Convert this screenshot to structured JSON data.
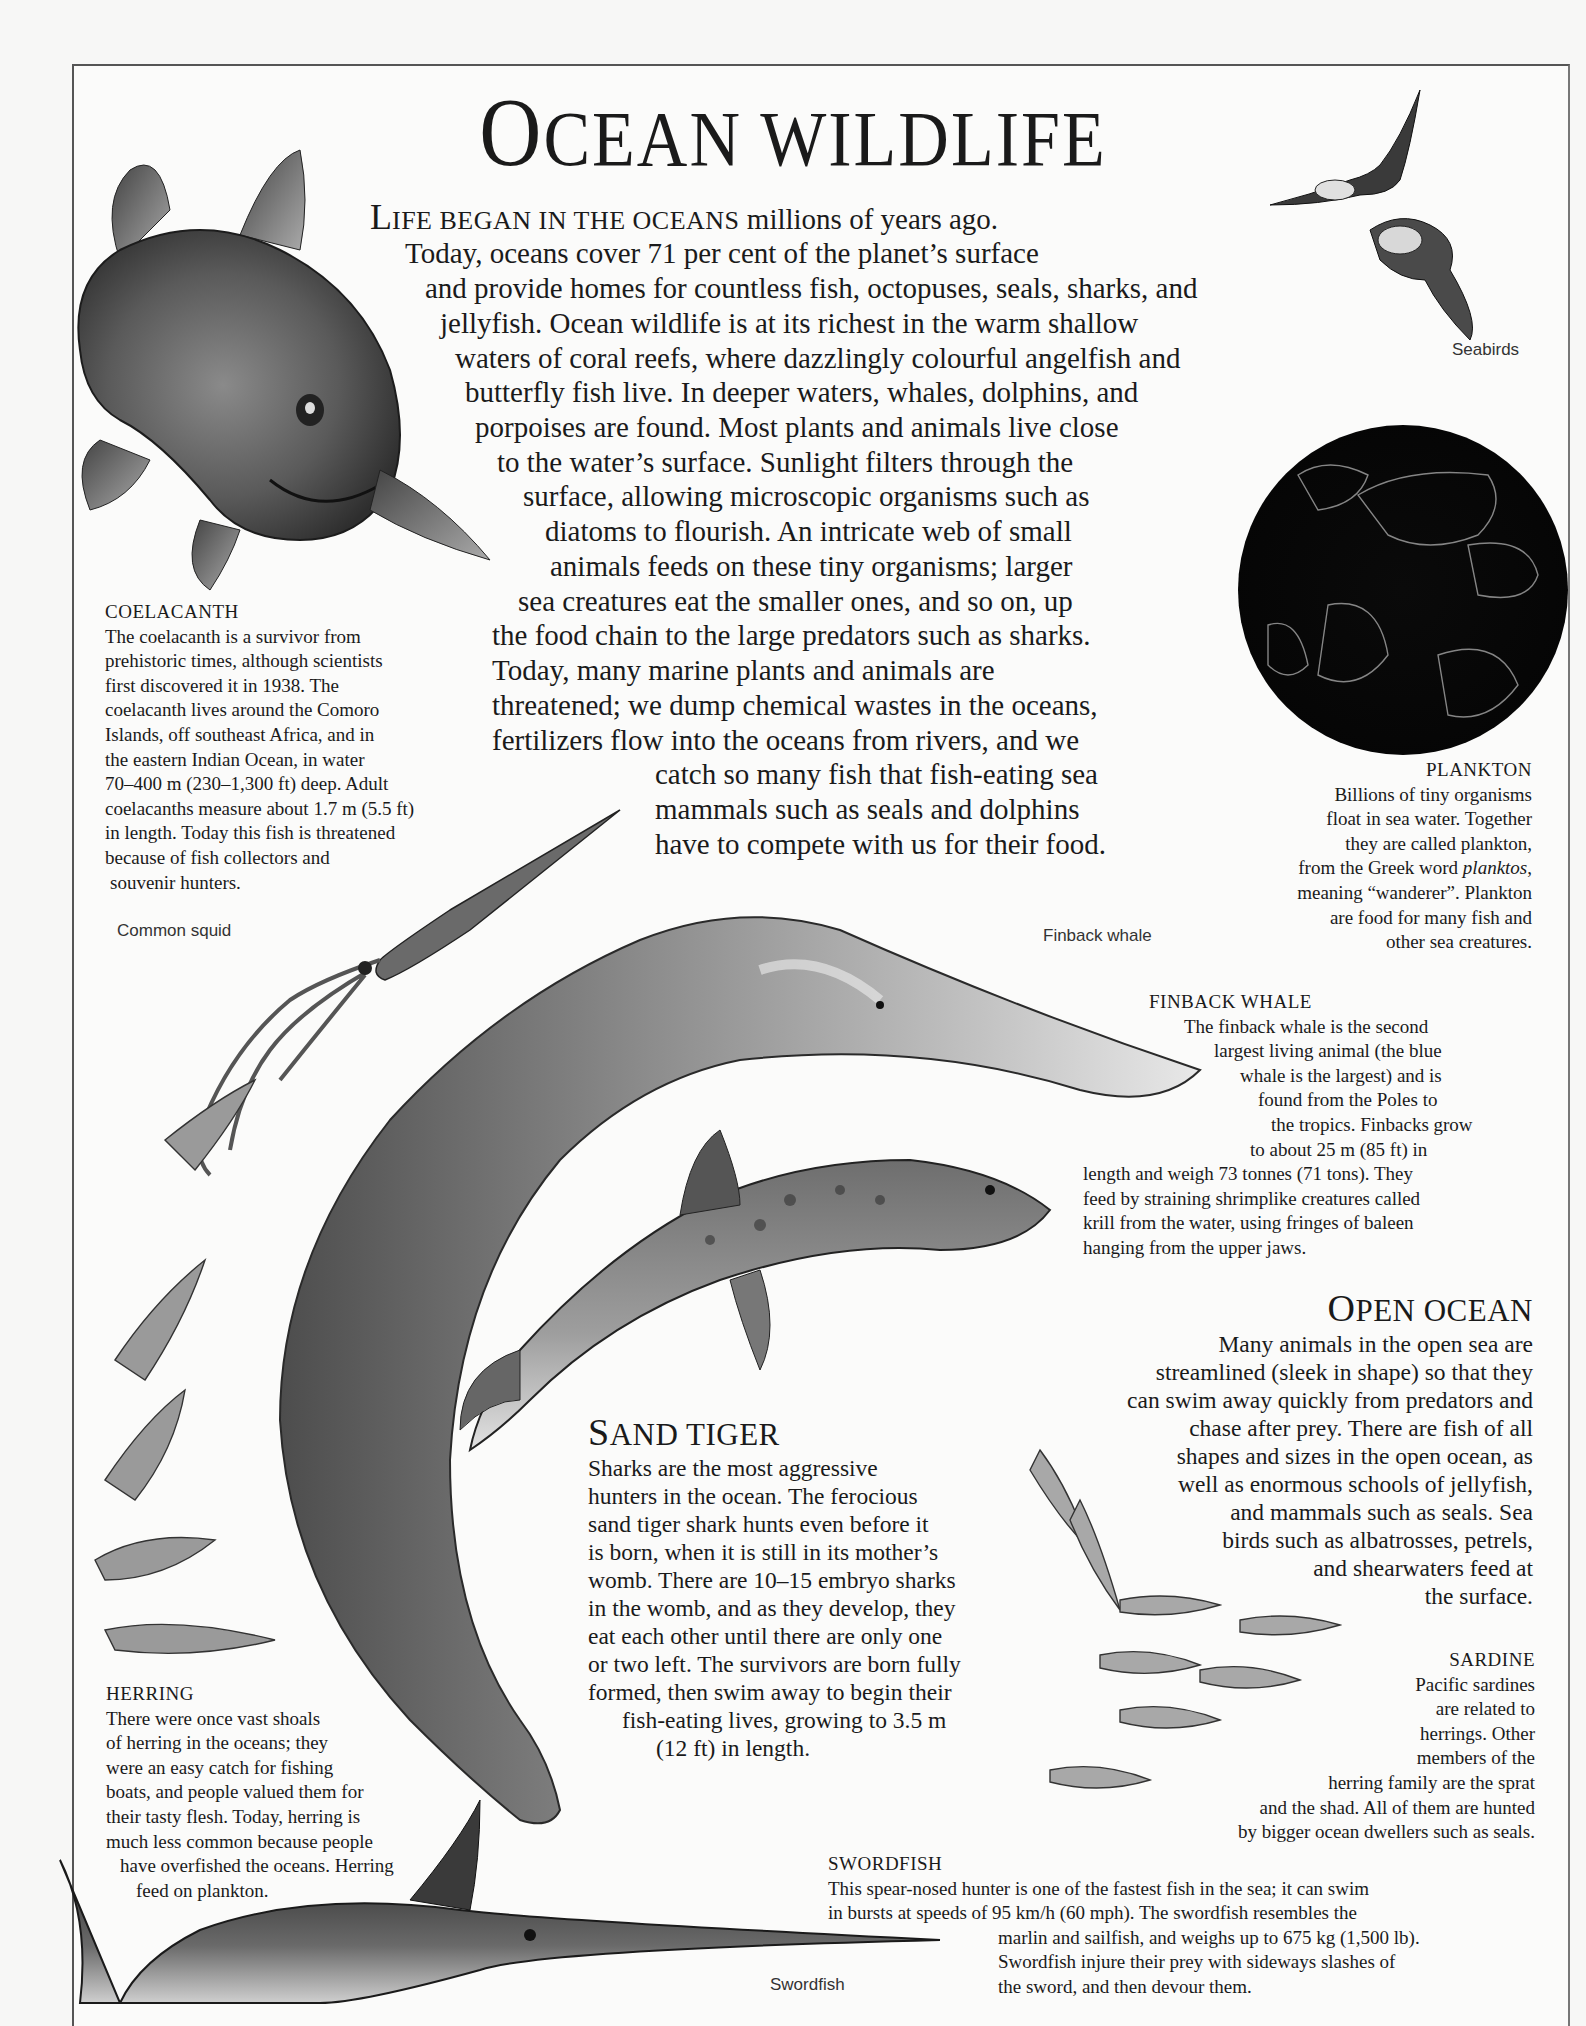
{
  "page": {
    "title_first": "O",
    "title_rest": "CEAN WILDLIFE"
  },
  "intro": {
    "lead_cap": "L",
    "lead_smallcaps": "IFE BEGAN IN THE OCEANS",
    "lines": [
      " millions of years ago.",
      "Today, oceans cover 71 per cent of the planet’s surface",
      "and provide homes for countless fish, octopuses, seals, sharks, and",
      "jellyfish. Ocean wildlife is at its richest in the warm shallow",
      "waters of coral reefs, where dazzlingly colourful angelfish and",
      "butterfly fish live. In deeper waters, whales, dolphins, and",
      "porpoises are found. Most plants and animals live close",
      "to the water’s surface. Sunlight filters through the",
      "surface, allowing microscopic organisms such as",
      "diatoms to flourish. An intricate web of small",
      "animals feeds on these tiny organisms; larger",
      "sea creatures eat the smaller ones, and so on, up",
      "the food chain to the large predators such as sharks.",
      "Today, many marine plants and animals are",
      "threatened; we dump chemical wastes in the oceans,",
      "fertilizers flow into the oceans from rivers, and we",
      "catch so many fish that fish-eating sea",
      "mammals such as seals and dolphins",
      "have to compete with us for their food."
    ]
  },
  "illustration_labels": {
    "seabirds": "Seabirds",
    "common_squid": "Common squid",
    "finback_whale": "Finback whale",
    "swordfish": "Swordfish"
  },
  "captions": {
    "coelacanth": {
      "heading": "COELACANTH",
      "lines": [
        "The coelacanth is a survivor from",
        "prehistoric times, although scientists",
        "first discovered it in 1938. The",
        "coelacanth lives around the Comoro",
        "Islands, off southeast Africa, and in",
        "the eastern Indian Ocean, in water",
        "70–400 m (230–1,300 ft) deep. Adult",
        "coelacanths measure about 1.7 m (5.5 ft)",
        "in length. Today this fish is threatened",
        "because of fish collectors and",
        " souvenir hunters."
      ]
    },
    "plankton": {
      "heading": "PLANKTON",
      "lines": [
        "Billions of tiny organisms",
        "float in sea water. Together",
        "they are called plankton,",
        "from the Greek word ",
        "meaning “wanderer”. Plankton",
        "are food for many fish and",
        "other sea creatures."
      ],
      "italic_word": "planktos",
      "italic_after": ","
    },
    "finback_whale": {
      "heading": "FINBACK WHALE",
      "lines": [
        "The finback whale is the second",
        "largest living animal (the blue",
        "whale is the largest) and is",
        "found from the Poles to",
        "the tropics. Finbacks grow",
        "to about 25 m (85 ft) in",
        "length and weigh 73 tonnes (71 tons). They",
        "feed by straining shrimplike creatures called",
        "krill from the water, using fringes of baleen",
        "hanging from the upper jaws."
      ]
    },
    "herring": {
      "heading": "HERRING",
      "lines": [
        "There were once vast shoals",
        "of herring in the oceans; they",
        "were an easy catch for fishing",
        "boats, and people valued them for",
        "their tasty flesh. Today, herring is",
        "much less common because people",
        "have overfished the oceans. Herring",
        "feed on plankton."
      ]
    },
    "sardine": {
      "heading": "SARDINE",
      "lines": [
        "Pacific sardines",
        "are related to",
        "herrings. Other",
        "members of the",
        "herring family are the sprat",
        "and the shad. All of them are hunted",
        "by bigger ocean dwellers such as seals."
      ]
    },
    "swordfish": {
      "heading": "SWORDFISH",
      "lines": [
        "This spear-nosed hunter is one of the fastest fish in the sea; it can swim",
        "in bursts at speeds of 95 km/h (60 mph). The swordfish resembles the",
        "marlin and sailfish, and weighs up to 675 kg (1,500 lb).",
        "Swordfish injure their prey with sideways slashes of",
        "the sword, and then devour them."
      ]
    }
  },
  "sections": {
    "open_ocean": {
      "heading_cap": "O",
      "heading_rest": "PEN OCEAN",
      "lines": [
        "Many animals in the open sea are",
        "streamlined (sleek in shape) so that they",
        "can swim away quickly from predators and",
        "chase after prey. There are fish of all",
        "shapes and sizes in the open ocean, as",
        "well as enormous schools of jellyfish,",
        "and mammals such as seals. Sea",
        "birds such as albatrosses, petrels,",
        "and shearwaters feed at",
        "the surface."
      ]
    },
    "sand_tiger": {
      "heading_cap": "S",
      "heading_rest": "AND TIGER",
      "lines": [
        "Sharks are the most aggressive",
        "hunters in the ocean. The ferocious",
        "sand tiger shark hunts even before it",
        "is born, when it is still in its mother’s",
        "womb. There are 10–15 embryo sharks",
        "in the womb, and as they develop, they",
        "eat each other until there are only one",
        "or two left. The survivors are born fully",
        "formed, then swim away to begin their",
        "fish-eating lives, growing to 3.5 m",
        "(12 ft) in length."
      ]
    }
  }
}
